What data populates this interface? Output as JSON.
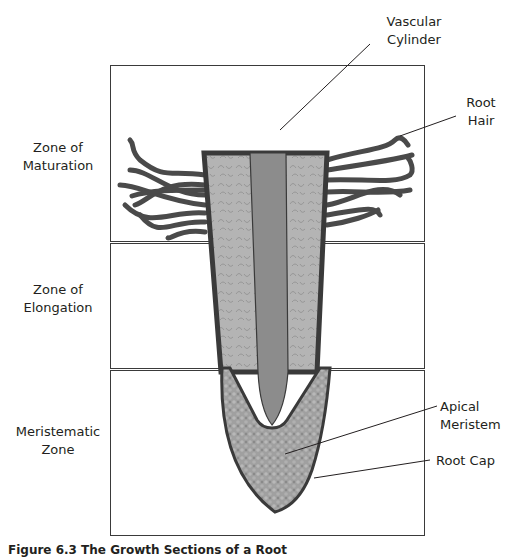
{
  "figure": {
    "caption": "Figure 6.3 The Growth Sections of a Root",
    "zones": [
      {
        "id": "maturation",
        "label_line1": "Zone of",
        "label_line2": "Maturation"
      },
      {
        "id": "elongation",
        "label_line1": "Zone of",
        "label_line2": "Elongation"
      },
      {
        "id": "meristematic",
        "label_line1": "Meristematic",
        "label_line2": "Zone"
      }
    ],
    "callouts": {
      "vascular_cylinder": {
        "line1": "Vascular",
        "line2": "Cylinder"
      },
      "root_hair": {
        "line1": "Root",
        "line2": "Hair"
      },
      "apical_meristem": {
        "line1": "Apical",
        "line2": "Meristem"
      },
      "root_cap": {
        "line1": "Root Cap"
      }
    },
    "colors": {
      "outline": "#3a3a3a",
      "cortex": "#b4b4b4",
      "vascular": "#8c8c8c",
      "cap": "#9e9e9e",
      "hair": "#4a4a4a"
    }
  }
}
